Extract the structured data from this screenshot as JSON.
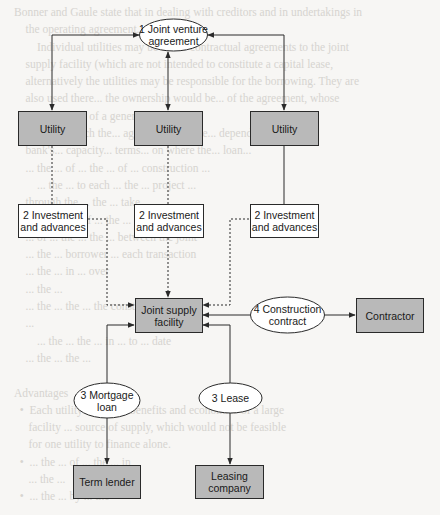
{
  "background_bleed_text": "Bonner and Gaule state that in dealing with creditors and in undertakings in\n    the operating agreement.\n        Individual utilities may be under contractual agreements to the joint\n    supply facility (which are not intended to constitute a capital lease,\n    alternatively the utilities may be responsible for the borrowing. They are\n    also used there... the ownership would be... of the agreement, whose\n    the successor of a general... venture...\n    The... in which the... agreement may be... depending upon the\n    bank's... capacity... terms... on where the... loan...\n    ... the ... of ... the ... of ... construction ... \n        ... the ... to each ... the ... project ...\n    through the ... the ... take ... \n    the ... for ... of ... the ... \n    ... of ... the ... the ... between the joint\n    ... the ... borrower ... each transaction\n    ... the ... in ... over\n    ... the ...\n    ... the ... the ... the construction\n    ... \n        ... the ... the ... in ... to ... date\n    ... the ... the ... \n\nAdvantages\n  •  Each utility can... the benefits and economies of a large\n     facility ... source of supply, which would not be feasible\n     for one utility to finance alone.\n  •  ... the ... of ... the ... in\n     ... the ... \n  •  ... the ... by ... the",
  "diagram": {
    "nodes": {
      "jv_agreement": {
        "label": "1 Joint venture\nagreement",
        "shape": "ellipse",
        "fill": "#ffffff"
      },
      "utility_1": {
        "label": "Utility",
        "shape": "rect",
        "fill": "#b9b9b9"
      },
      "utility_2": {
        "label": "Utility",
        "shape": "rect",
        "fill": "#b9b9b9"
      },
      "utility_3": {
        "label": "Utility",
        "shape": "rect",
        "fill": "#b9b9b9"
      },
      "investment_1": {
        "label": "2 Investment\nand advances",
        "shape": "rect",
        "fill": "#ffffff"
      },
      "investment_2": {
        "label": "2 Investment\nand advances",
        "shape": "rect",
        "fill": "#ffffff"
      },
      "investment_3": {
        "label": "2 Investment\nand advances",
        "shape": "rect",
        "fill": "#ffffff"
      },
      "joint_supply": {
        "label": "Joint supply\nfacility",
        "shape": "rect",
        "fill": "#b9b9b9"
      },
      "construction_contract": {
        "label": "4 Construction\ncontract",
        "shape": "ellipse",
        "fill": "#ffffff"
      },
      "contractor": {
        "label": "Contractor",
        "shape": "rect",
        "fill": "#b9b9b9"
      },
      "mortgage_loan": {
        "label": "3 Mortgage\nloan",
        "shape": "ellipse",
        "fill": "#ffffff"
      },
      "lease": {
        "label": "3 Lease",
        "shape": "ellipse",
        "fill": "#ffffff"
      },
      "term_lender": {
        "label": "Term lender",
        "shape": "rect",
        "fill": "#b9b9b9"
      },
      "leasing_company": {
        "label": "Leasing\ncompany",
        "shape": "rect",
        "fill": "#b9b9b9"
      }
    },
    "edges": [
      {
        "from": "jv_agreement",
        "to": "utility_1",
        "style": "solid",
        "arrows": "both"
      },
      {
        "from": "jv_agreement",
        "to": "utility_2",
        "style": "solid",
        "arrows": "both"
      },
      {
        "from": "jv_agreement",
        "to": "utility_3",
        "style": "solid",
        "arrows": "both"
      },
      {
        "from": "utility_1",
        "to": "investment_1",
        "style": "dotted",
        "arrows": "none"
      },
      {
        "from": "utility_2",
        "to": "investment_2",
        "style": "dotted",
        "arrows": "none"
      },
      {
        "from": "utility_3",
        "to": "investment_3",
        "style": "solid",
        "arrows": "none"
      },
      {
        "from": "investment_1",
        "to": "joint_supply",
        "style": "dotted",
        "arrows": "end"
      },
      {
        "from": "investment_2",
        "to": "joint_supply",
        "style": "dotted",
        "arrows": "end"
      },
      {
        "from": "investment_3",
        "to": "joint_supply",
        "style": "dotted",
        "arrows": "end"
      },
      {
        "from": "construction_contract",
        "to": "joint_supply",
        "style": "solid",
        "arrows": "end"
      },
      {
        "from": "construction_contract",
        "to": "contractor",
        "style": "solid",
        "arrows": "end"
      },
      {
        "from": "mortgage_loan",
        "to": "joint_supply",
        "style": "solid",
        "arrows": "end"
      },
      {
        "from": "mortgage_loan",
        "to": "term_lender",
        "style": "solid",
        "arrows": "end"
      },
      {
        "from": "lease",
        "to": "joint_supply",
        "style": "solid",
        "arrows": "end"
      },
      {
        "from": "lease",
        "to": "leasing_company",
        "style": "solid",
        "arrows": "end"
      }
    ],
    "colors": {
      "line": "#2a2a2a",
      "box_border": "#2a2a2a",
      "shaded_fill": "#b9b9b9",
      "white_fill": "#ffffff"
    }
  }
}
